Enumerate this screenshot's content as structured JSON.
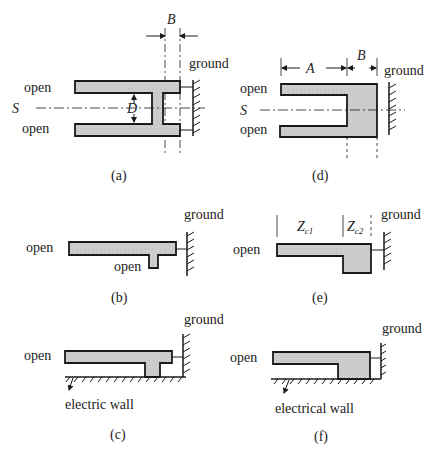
{
  "figure": {
    "panels": [
      {
        "id": "a",
        "caption": "(a)",
        "labels": {
          "top_open": "open",
          "bottom_open": "open",
          "symmetry": "S",
          "width_dim": "B",
          "gap_dim": "D",
          "ground": "ground"
        }
      },
      {
        "id": "b",
        "caption": "(b)",
        "labels": {
          "open_left": "open",
          "open_stub": "open",
          "ground": "ground"
        }
      },
      {
        "id": "c",
        "caption": "(c)",
        "labels": {
          "open_left": "open",
          "ground": "ground",
          "wall": "electric wall"
        }
      },
      {
        "id": "d",
        "caption": "(d)",
        "labels": {
          "top_open": "open",
          "bottom_open": "open",
          "symmetry": "S",
          "length_dim": "A",
          "width_dim": "B",
          "ground": "ground"
        }
      },
      {
        "id": "e",
        "caption": "(e)",
        "labels": {
          "open_left": "open",
          "z1": "Z",
          "z1_sub": "c1",
          "z2": "Z",
          "z2_sub": "c2",
          "ground": "ground"
        }
      },
      {
        "id": "f",
        "caption": "(f)",
        "labels": {
          "open_left": "open",
          "ground": "ground",
          "wall": "electrical wall"
        }
      }
    ],
    "colors": {
      "fill": "#c8c8c8",
      "stroke": "#1a1a1a"
    }
  }
}
